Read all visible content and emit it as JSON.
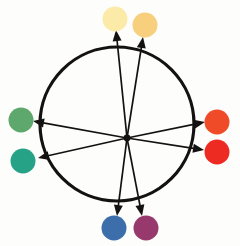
{
  "figure": {
    "background_color": "#fdfdfb",
    "width": 240,
    "height": 246
  },
  "wheel": {
    "name": "color-wheel-circle",
    "center_x": 117,
    "center_y": 124,
    "radius": 77,
    "stroke_color": "#141210",
    "stroke_width": 3.2,
    "fill": "none"
  },
  "hub": {
    "name": "vector-origin-hub",
    "x": 127,
    "y": 138,
    "radius": 3.4,
    "color": "#141210"
  },
  "arrow_style": {
    "stroke_color": "#141210",
    "stroke_width": 1.7,
    "head_length": 11,
    "head_width": 9
  },
  "vectors": [
    {
      "id": "vector-pale-yellow",
      "label": "pale yellow",
      "angle_deg": 95,
      "x1": 127,
      "y1": 138,
      "x2": 116,
      "y2": 30
    },
    {
      "id": "vector-golden-yellow",
      "label": "golden yellow",
      "angle_deg": 78,
      "x1": 127,
      "y1": 138,
      "x2": 143,
      "y2": 37
    },
    {
      "id": "vector-orange-red",
      "label": "orange red",
      "angle_deg": 6,
      "x1": 127,
      "y1": 138,
      "x2": 205,
      "y2": 122
    },
    {
      "id": "vector-red",
      "label": "red",
      "angle_deg": -9,
      "x1": 127,
      "y1": 138,
      "x2": 204,
      "y2": 150
    },
    {
      "id": "vector-magenta",
      "label": "magenta",
      "angle_deg": -79,
      "x1": 127,
      "y1": 138,
      "x2": 142,
      "y2": 216
    },
    {
      "id": "vector-blue",
      "label": "blue",
      "angle_deg": -96,
      "x1": 127,
      "y1": 138,
      "x2": 117,
      "y2": 216
    },
    {
      "id": "vector-teal",
      "label": "teal",
      "angle_deg": -167,
      "x1": 127,
      "y1": 138,
      "x2": 38,
      "y2": 158
    },
    {
      "id": "vector-green",
      "label": "green",
      "angle_deg": 169,
      "x1": 127,
      "y1": 138,
      "x2": 33,
      "y2": 121
    }
  ],
  "swatches": [
    {
      "id": "swatch-pale-yellow",
      "label": "pale yellow",
      "color": "#fbeaa8",
      "cx": 115,
      "cy": 19,
      "r": 12.5
    },
    {
      "id": "swatch-golden-yellow",
      "label": "golden yellow",
      "color": "#f8cf7c",
      "cx": 145,
      "cy": 25,
      "r": 12.5
    },
    {
      "id": "swatch-orange-red",
      "label": "orange red",
      "color": "#f04b28",
      "cx": 217,
      "cy": 122,
      "r": 12.5
    },
    {
      "id": "swatch-red",
      "label": "red",
      "color": "#ed2b22",
      "cx": 217,
      "cy": 152,
      "r": 12.5
    },
    {
      "id": "swatch-magenta",
      "label": "magenta",
      "color": "#97396d",
      "cx": 146,
      "cy": 228,
      "r": 12.5
    },
    {
      "id": "swatch-blue",
      "label": "blue",
      "color": "#3b6eaa",
      "cx": 114,
      "cy": 228,
      "r": 12.5
    },
    {
      "id": "swatch-teal",
      "label": "teal",
      "color": "#26a287",
      "cx": 23,
      "cy": 161,
      "r": 12.5
    },
    {
      "id": "swatch-green",
      "label": "green",
      "color": "#5fa86d",
      "cx": 21,
      "cy": 120,
      "r": 12.5
    }
  ]
}
